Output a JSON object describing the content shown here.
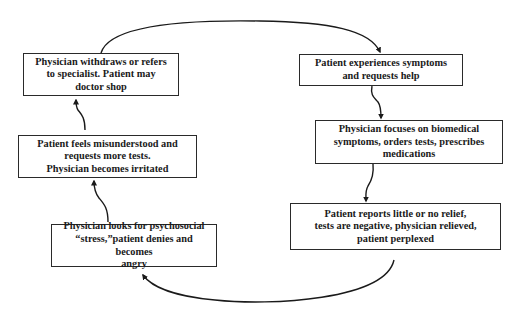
{
  "diagram": {
    "type": "cycle",
    "nodes": [
      {
        "id": "withdraws",
        "label": "Physician withdraws or refers\nto specialist. Patient may\ndoctor shop"
      },
      {
        "id": "experiences",
        "label": "Patient experiences symptoms\nand requests help"
      },
      {
        "id": "focuses",
        "label": "Physician focuses on biomedical\nsymptoms, orders tests, prescribes\nmedications"
      },
      {
        "id": "reports",
        "label": "Patient reports little or no relief,\ntests are negative, physician relieved,\npatient perplexed"
      },
      {
        "id": "looks",
        "label": "Physician looks for psychosocial\n“stress,”patient denies and becomes\nangry"
      },
      {
        "id": "feels",
        "label": "Patient feels misunderstood and\nrequests more tests.\nPhysician becomes irritated"
      }
    ],
    "edges": [
      {
        "from": "withdraws",
        "to": "experiences"
      },
      {
        "from": "experiences",
        "to": "focuses"
      },
      {
        "from": "focuses",
        "to": "reports"
      },
      {
        "from": "reports",
        "to": "looks"
      },
      {
        "from": "looks",
        "to": "feels"
      },
      {
        "from": "feels",
        "to": "withdraws"
      }
    ],
    "colors": {
      "stroke": "#1a1a1a",
      "background": "#ffffff"
    }
  }
}
